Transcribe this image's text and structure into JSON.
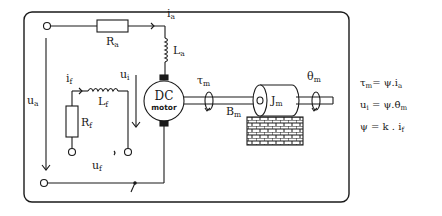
{
  "diagram": {
    "motor": {
      "line1": "DC",
      "line2": "motor"
    },
    "labels": {
      "ia_main": "i",
      "ia_sub": "a",
      "Ra_main": "R",
      "Ra_sub": "a",
      "La_main": "L",
      "La_sub": "a",
      "ua_main": "u",
      "ua_sub": "a",
      "if_main": "i",
      "if_sub": "f",
      "Lf_main": "L",
      "Lf_sub": "f",
      "Rf_main": "R",
      "Rf_sub": "f",
      "uf_main": "u",
      "uf_sub": "f",
      "ui_main": "u",
      "ui_sub": "i",
      "tau_main": "τ",
      "tau_sub": "m",
      "Bm_main": "B",
      "Bm_sub": "m",
      "Jm_main": "J",
      "Jm_sub": "m",
      "theta_main": "θ",
      "theta_sub": "m"
    },
    "equations": [
      {
        "lhs": "τ",
        "lhs_sub": "m",
        "rhs": "= ψ.i",
        "rhs_sub": "a"
      },
      {
        "lhs": "u",
        "lhs_sub": "i",
        "rhs": " = ψ.θ̇",
        "rhs_sub": "m"
      },
      {
        "lhs": "ψ",
        "lhs_sub": "",
        "rhs": " = k . i",
        "rhs_sub": "f"
      }
    ],
    "colors": {
      "line": "#1a1a1a",
      "background": "#ffffff"
    }
  }
}
